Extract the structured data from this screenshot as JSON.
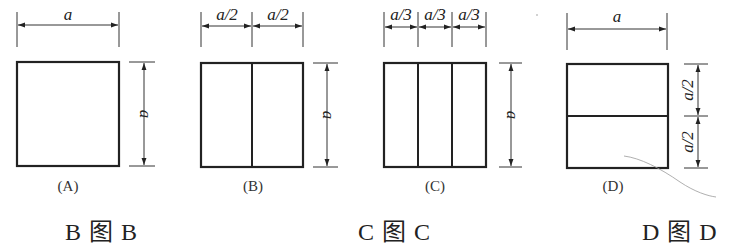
{
  "figure": {
    "panels": [
      {
        "id": "A",
        "caption": "(A)",
        "top_dims": [
          "a"
        ],
        "side_dims": [
          "a"
        ],
        "division": "none",
        "parts": 1
      },
      {
        "id": "B",
        "caption": "(B)",
        "top_dims": [
          "a/2",
          "a/2"
        ],
        "side_dims": [
          "a"
        ],
        "division": "vertical",
        "parts": 2
      },
      {
        "id": "C",
        "caption": "(C)",
        "top_dims": [
          "a/3",
          "a/3",
          "a/3"
        ],
        "side_dims": [
          "a"
        ],
        "division": "vertical",
        "parts": 3
      },
      {
        "id": "D",
        "caption": "(D)",
        "top_dims": [
          "a"
        ],
        "side_dims": [
          "a/2",
          "a/2"
        ],
        "division": "horizontal",
        "parts": 2
      }
    ]
  },
  "answers": [
    {
      "label": "B  图 B"
    },
    {
      "label": "C  图 C"
    },
    {
      "label": "D  图 D"
    }
  ],
  "colors": {
    "line": "#222222",
    "thin_line": "#333333",
    "stray_mark": "#9a9a9a",
    "background": "#ffffff"
  }
}
